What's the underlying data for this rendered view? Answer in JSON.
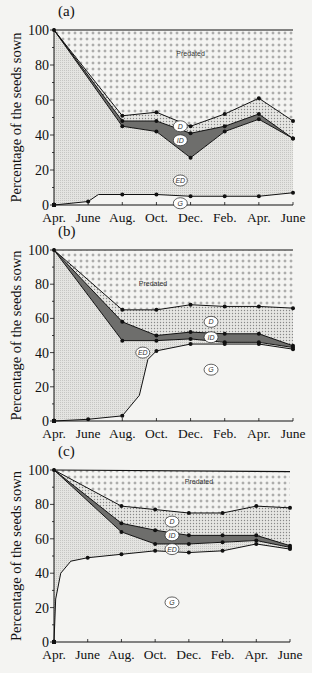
{
  "figure": {
    "ylabel": "Percentage of the seeds sown",
    "months": [
      "Apr.",
      "June",
      "Aug.",
      "Oct.",
      "Dec.",
      "Feb.",
      "Apr.",
      "June"
    ],
    "yticks": [
      0,
      20,
      40,
      60,
      80,
      100
    ],
    "region_labels": {
      "predated": "Predated",
      "D": "D",
      "ID": "ID",
      "ED": "ED",
      "G": "G"
    }
  },
  "chart_data": [
    {
      "panel": "(a)",
      "type": "area",
      "title": "(a)",
      "xlabel": "",
      "ylabel": "Percentage of the seeds sown",
      "ylim": [
        0,
        100
      ],
      "categories": [
        "Apr.",
        "June",
        "Aug.",
        "Oct.",
        "Dec.",
        "Feb.",
        "Apr.",
        "June"
      ],
      "legend": [
        "Predated",
        "D",
        "ID",
        "ED",
        "G"
      ],
      "series": [
        {
          "name": "Predated (upper bound)",
          "x": [
            0,
            7
          ],
          "values": [
            100,
            100
          ]
        },
        {
          "name": "Predated/D boundary",
          "x": [
            0,
            2,
            3,
            4,
            5,
            6,
            7
          ],
          "values": [
            100,
            51,
            53,
            45,
            52,
            61,
            48
          ]
        },
        {
          "name": "D/ID boundary",
          "x": [
            0,
            2,
            3,
            4,
            5,
            6,
            7
          ],
          "values": [
            100,
            48,
            48,
            41,
            45,
            52,
            38
          ]
        },
        {
          "name": "ID/ED boundary",
          "x": [
            0,
            2,
            3,
            4,
            5,
            6,
            7
          ],
          "values": [
            100,
            45,
            42,
            27,
            42,
            49,
            38
          ]
        },
        {
          "name": "ED/G boundary (germinated)",
          "x": [
            0,
            1,
            1.3,
            2,
            3,
            4,
            5,
            6,
            7
          ],
          "values": [
            0,
            2,
            6,
            6,
            6,
            5,
            5,
            5,
            7
          ]
        }
      ],
      "label_positions": {
        "predated": [
          4,
          85
        ],
        "D": [
          3.7,
          45
        ],
        "ID": [
          3.7,
          37
        ],
        "ED": [
          3.7,
          14
        ],
        "G": [
          3.7,
          1
        ]
      }
    },
    {
      "panel": "(b)",
      "type": "area",
      "title": "(b)",
      "xlabel": "",
      "ylabel": "Percentage of the seeds sown",
      "ylim": [
        0,
        100
      ],
      "categories": [
        "Apr.",
        "June",
        "Aug.",
        "Oct.",
        "Dec.",
        "Feb.",
        "Apr.",
        "June"
      ],
      "legend": [
        "Predated",
        "D",
        "ID",
        "ED",
        "G"
      ],
      "series": [
        {
          "name": "Predated (upper bound)",
          "x": [
            0,
            7
          ],
          "values": [
            100,
            100
          ]
        },
        {
          "name": "Predated/D boundary",
          "x": [
            0,
            2,
            3,
            4,
            5,
            6,
            7
          ],
          "values": [
            100,
            65,
            65,
            68,
            67,
            67,
            66
          ]
        },
        {
          "name": "D/ID boundary",
          "x": [
            0,
            2,
            3,
            4,
            5,
            6,
            7
          ],
          "values": [
            100,
            58,
            50,
            52,
            51,
            51,
            44
          ]
        },
        {
          "name": "ID/ED boundary",
          "x": [
            0,
            2,
            3,
            4,
            5,
            6,
            7
          ],
          "values": [
            100,
            47,
            47,
            48,
            46,
            46,
            43
          ]
        },
        {
          "name": "ED/G boundary (germinated)",
          "x": [
            0,
            1,
            2,
            2.5,
            2.75,
            3,
            4,
            5,
            6,
            7
          ],
          "values": [
            0,
            1,
            3,
            15,
            36,
            41,
            45,
            45,
            45,
            42
          ]
        }
      ],
      "label_positions": {
        "predated": [
          2.9,
          79
        ],
        "D": [
          4.6,
          58
        ],
        "ID": [
          4.6,
          49
        ],
        "ED": [
          2.6,
          40
        ],
        "G": [
          4.6,
          30
        ]
      }
    },
    {
      "panel": "(c)",
      "type": "area",
      "title": "(c)",
      "xlabel": "",
      "ylabel": "Percentage of the seeds sown",
      "ylim": [
        0,
        100
      ],
      "categories": [
        "Apr.",
        "June",
        "Aug.",
        "Oct.",
        "Dec.",
        "Feb.",
        "Apr.",
        "June"
      ],
      "legend": [
        "Predated",
        "D",
        "ID",
        "ED",
        "G"
      ],
      "series": [
        {
          "name": "Predated (upper bound)",
          "x": [
            0,
            7
          ],
          "values": [
            100,
            99
          ]
        },
        {
          "name": "Predated/D boundary",
          "x": [
            0,
            2,
            3,
            4,
            5,
            6,
            7
          ],
          "values": [
            100,
            79,
            77,
            75,
            75,
            79,
            78
          ]
        },
        {
          "name": "D/ID boundary",
          "x": [
            0,
            2,
            3,
            4,
            5,
            6,
            7
          ],
          "values": [
            100,
            69,
            65,
            62,
            62,
            62,
            56
          ]
        },
        {
          "name": "ID/ED boundary",
          "x": [
            0,
            2,
            3,
            4,
            5,
            6,
            7
          ],
          "values": [
            100,
            64,
            57,
            57,
            58,
            59,
            55
          ]
        },
        {
          "name": "ED/G boundary (germinated)",
          "x": [
            0,
            0.05,
            0.2,
            0.5,
            1,
            2,
            3,
            4,
            5,
            6,
            7
          ],
          "values": [
            0,
            25,
            40,
            47,
            49,
            51,
            53,
            52,
            53,
            57,
            54
          ]
        }
      ],
      "label_positions": {
        "predated": [
          4.3,
          92
        ],
        "D": [
          3.5,
          70
        ],
        "ID": [
          3.5,
          62
        ],
        "ED": [
          3.5,
          54
        ],
        "G": [
          3.5,
          23
        ]
      }
    }
  ],
  "panels_layout": [
    {
      "x0": 54,
      "x1": 293,
      "y100": 30,
      "y0": 205
    },
    {
      "x0": 54,
      "x1": 293,
      "y100": 250,
      "y0": 421
    },
    {
      "x0": 54,
      "x1": 290,
      "y100": 470,
      "y0": 642
    }
  ],
  "colors": {
    "background": "#f4f4f2",
    "predated_dot": "#555555",
    "d_fill": "#cfcfcc",
    "id_fill": "#6e6e6c",
    "ed_fill": "#dcdcda",
    "g_fill": "#f4f4f2",
    "line": "#111111"
  }
}
